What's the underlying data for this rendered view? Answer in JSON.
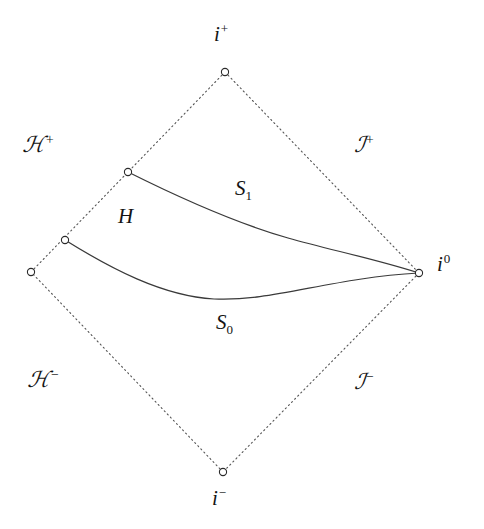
{
  "figure": {
    "kind": "penrose-conformal-diagram",
    "background_color": "#ffffff",
    "line_color": "#3a3a3a",
    "dotted_color": "#555555",
    "text_color": "#141414"
  },
  "labels": {
    "i_plus": {
      "base": "i",
      "sup": "+",
      "name": "future timelike infinity"
    },
    "i_minus": {
      "base": "i",
      "sup": "−",
      "name": "past timelike infinity"
    },
    "i_zero": {
      "base": "i",
      "sup": "0",
      "name": "spatial infinity"
    },
    "horizon_plus": {
      "base": "ℋ",
      "sup": "+",
      "name": "future horizon"
    },
    "horizon_minus": {
      "base": "ℋ",
      "sup": "−",
      "name": "past horizon"
    },
    "scri_plus": {
      "base": "ℐ",
      "sup": "+",
      "name": "future null infinity"
    },
    "scri_minus": {
      "base": "ℐ",
      "sup": "−",
      "name": "past null infinity"
    },
    "slice_S1": {
      "base": "S",
      "sub": "1",
      "name": "later Cauchy slice"
    },
    "slice_S0": {
      "base": "S",
      "sub": "0",
      "name": "earlier Cauchy slice"
    },
    "region_H": {
      "base": "H",
      "name": "region between slices"
    }
  },
  "geometry": {
    "vertices": {
      "top": {
        "x": 225,
        "y": 72,
        "label": "i_plus"
      },
      "right": {
        "x": 419,
        "y": 273,
        "label": "i_zero"
      },
      "bottom": {
        "x": 223,
        "y": 472,
        "label": "i_minus"
      },
      "left": {
        "x": 31,
        "y": 272,
        "label": "h_corner"
      }
    },
    "markers": [
      {
        "x": 225,
        "y": 72,
        "name": "vertex-i-plus"
      },
      {
        "x": 419,
        "y": 273,
        "name": "vertex-i-zero"
      },
      {
        "x": 223,
        "y": 472,
        "name": "vertex-i-minus"
      },
      {
        "x": 31,
        "y": 272,
        "name": "vertex-left"
      },
      {
        "x": 128,
        "y": 172,
        "name": "endpoint-S1-left"
      },
      {
        "x": 65,
        "y": 240,
        "name": "endpoint-S0-left"
      }
    ],
    "dotted_edges": [
      {
        "name": "edge-horizon-plus",
        "from": [
          31,
          272
        ],
        "to": [
          225,
          72
        ]
      },
      {
        "name": "edge-scri-plus",
        "from": [
          225,
          72
        ],
        "to": [
          419,
          273
        ]
      },
      {
        "name": "edge-scri-minus",
        "from": [
          419,
          273
        ],
        "to": [
          223,
          472
        ]
      },
      {
        "name": "edge-horizon-minus",
        "from": [
          223,
          472
        ],
        "to": [
          31,
          272
        ]
      }
    ],
    "curves": {
      "S1": {
        "name": "curve-S1",
        "path": "M128,172 C 176,196 232,222 288,238 C 330,250 372,258 419,273",
        "from": [
          128,
          172
        ],
        "to": [
          419,
          273
        ]
      },
      "S0": {
        "name": "curve-S0",
        "path": "M65,240 C 110,268 162,296 214,299 C 272,302 330,278 419,273",
        "from": [
          65,
          240
        ],
        "to": [
          419,
          273
        ]
      }
    },
    "marker_radius": 3.6
  }
}
